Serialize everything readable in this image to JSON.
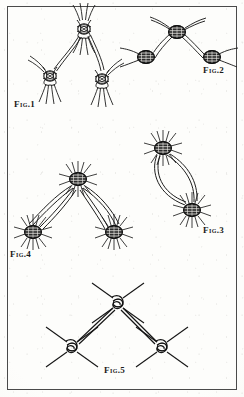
{
  "plate": {
    "type": "line-illustration-plate",
    "description": "Engraved plate of five figures showing knotted and twisted wire net joints",
    "background_color": "#fdfdfb",
    "ink_color": "#1a1a1a",
    "border_color": "#4a4a4a",
    "width": 244,
    "height": 397
  },
  "figures": [
    {
      "id": "fig1",
      "label": "Fig.1",
      "label_x": 14,
      "label_y": 100,
      "knot_style": "twisted-strand-loop",
      "knot_count": 3,
      "knots": [
        {
          "cx": 84,
          "cy": 29,
          "r": 9
        },
        {
          "cx": 50,
          "cy": 76,
          "r": 8
        },
        {
          "cx": 102,
          "cy": 79,
          "r": 8
        }
      ]
    },
    {
      "id": "fig2",
      "label": "Fig.2",
      "label_x": 203,
      "label_y": 66,
      "knot_style": "dense-wrapped-cross",
      "knot_count": 3,
      "knots": [
        {
          "cx": 177,
          "cy": 32,
          "r": 8
        },
        {
          "cx": 146,
          "cy": 57,
          "r": 8
        },
        {
          "cx": 212,
          "cy": 57,
          "r": 8
        }
      ]
    },
    {
      "id": "fig3",
      "label": "Fig.3",
      "label_x": 203,
      "label_y": 226,
      "knot_style": "dense-wrapped-cross-with-loop",
      "knot_count": 2,
      "knots": [
        {
          "cx": 163,
          "cy": 148,
          "r": 10
        },
        {
          "cx": 192,
          "cy": 210,
          "r": 10
        }
      ]
    },
    {
      "id": "fig4",
      "label": "Fig.4",
      "label_x": 10,
      "label_y": 250,
      "knot_style": "dense-wrapped-cross-with-loop",
      "knot_count": 3,
      "knots": [
        {
          "cx": 78,
          "cy": 179,
          "r": 11
        },
        {
          "cx": 33,
          "cy": 232,
          "r": 11
        },
        {
          "cx": 114,
          "cy": 232,
          "r": 11
        }
      ]
    },
    {
      "id": "fig5",
      "label": "Fig.5",
      "label_x": 104,
      "label_y": 366,
      "knot_style": "simple-overhand-cross",
      "knot_count": 3,
      "knots": [
        {
          "cx": 118,
          "cy": 303,
          "r": 8
        },
        {
          "cx": 72,
          "cy": 347,
          "r": 8
        },
        {
          "cx": 162,
          "cy": 347,
          "r": 8
        }
      ]
    }
  ]
}
